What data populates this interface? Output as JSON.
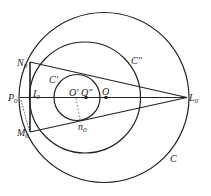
{
  "diagram": {
    "circles": [
      {
        "name": "C",
        "cx": 104,
        "cy": 97.5,
        "r": 85
      },
      {
        "name": "C''",
        "cx": 85,
        "cy": 97.5,
        "r": 55.5
      },
      {
        "name": "C'",
        "cx": 77,
        "cy": 97.5,
        "r": 23
      }
    ],
    "points": {
      "N0": {
        "x": 30,
        "y": 62
      },
      "M0": {
        "x": 30,
        "y": 132
      },
      "P0": {
        "x": 20,
        "y": 97.5
      },
      "I0": {
        "x": 31,
        "y": 97.5
      },
      "L0": {
        "x": 187,
        "y": 97.5
      },
      "O": {
        "x": 106,
        "y": 97.5
      },
      "O2": {
        "x": 86,
        "y": 97.5
      },
      "n0": {
        "x": 80,
        "y": 120
      }
    },
    "labels": {
      "N0": "N",
      "M0": "M",
      "P0": "P",
      "I0": "I",
      "L0": "L",
      "n0": "n",
      "sub0": "0",
      "O": "O",
      "Op": "O'",
      "Opp": "O''",
      "C": "C",
      "Cp": "C'",
      "Cpp": "C''"
    },
    "stroke_color": "#222222"
  }
}
